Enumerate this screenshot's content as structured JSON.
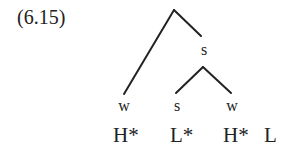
{
  "example_number": "(6.15)",
  "tree": {
    "root_children_label": "s",
    "leaves": [
      {
        "label": "w"
      },
      {
        "label": "s"
      },
      {
        "label": "w"
      }
    ]
  },
  "tones": [
    "H*",
    "L*",
    "H*",
    "L"
  ]
}
